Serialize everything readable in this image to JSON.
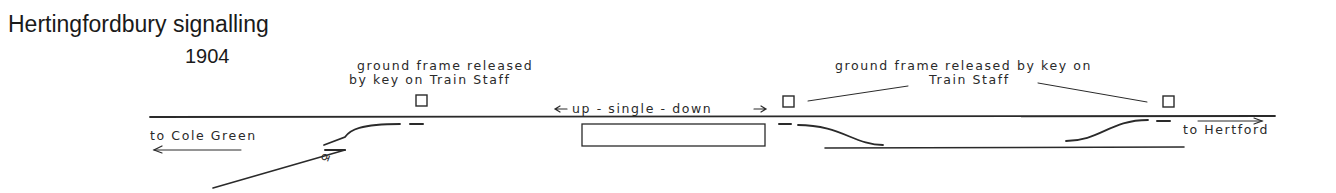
{
  "title": "Hertingfordbury signalling",
  "year": "1904",
  "labels": {
    "left_frame_line1": "ground frame released",
    "left_frame_line2": "by key on Train Staff",
    "right_frame_line1": "ground frame released by key on",
    "right_frame_line2": "Train Staff",
    "single_line": "up - single - down",
    "to_left": "to Cole Green",
    "to_right": "to Hertford"
  },
  "colors": {
    "ink": "#2a2a2a",
    "background": "#ffffff"
  }
}
